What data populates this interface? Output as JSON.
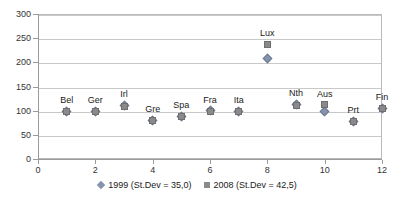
{
  "chart_data": {
    "type": "scatter",
    "title": "",
    "subtitle": "",
    "xlabel": "",
    "ylabel": "",
    "xlim": [
      0,
      12
    ],
    "ylim": [
      0,
      300
    ],
    "x_ticks": [
      0,
      2,
      4,
      6,
      8,
      10,
      12
    ],
    "x_tick_labels": [
      "0",
      "2",
      "4",
      "6",
      "8",
      "10",
      "12"
    ],
    "y_ticks": [
      0,
      50,
      100,
      150,
      200,
      250,
      300
    ],
    "y_tick_labels": [
      "0",
      "50",
      "100",
      "150",
      "200",
      "250",
      "300"
    ],
    "grid": "horizontal",
    "legend_position": "bottom-center",
    "categories": [
      "Bel",
      "Ger",
      "Irl",
      "Gre",
      "Spa",
      "Fra",
      "Ita",
      "Lux",
      "Nth",
      "Aus",
      "Prt",
      "Fin"
    ],
    "x": [
      1,
      2,
      3,
      4,
      5,
      6,
      7,
      8,
      9,
      10,
      11,
      12
    ],
    "point_labels": [
      "Bel",
      "Ger",
      "Irl",
      "Gre",
      "Spa",
      "Fra",
      "Ita",
      "Lux",
      "Nth",
      "Aus",
      "Prt",
      "Fin"
    ],
    "series": [
      {
        "name": "1999 (St.Dev = 35,0)",
        "marker": "diamond",
        "color": "#8693ab",
        "values": [
          99,
          99,
          111,
          80,
          88,
          100,
          99,
          207,
          113,
          99,
          78,
          105
        ]
      },
      {
        "name": "2008 (St.Dev = 42,5)",
        "marker": "square",
        "color": "#8a8a8a",
        "values": [
          99,
          99,
          109,
          79,
          87,
          99,
          98,
          237,
          110,
          112,
          78,
          104
        ]
      }
    ],
    "legend": [
      {
        "label": "1999 (St.Dev = 35,0)",
        "marker": "diamond",
        "color": "#8693ab"
      },
      {
        "label": "2008 (St.Dev = 42,5)",
        "marker": "square",
        "color": "#8a8a8a"
      }
    ]
  }
}
